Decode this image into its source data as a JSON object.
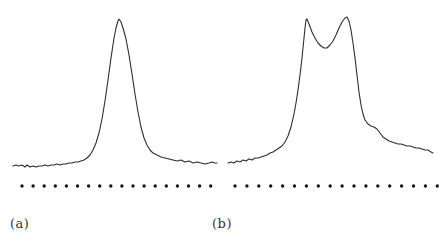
{
  "figure": {
    "background": "#ffffff",
    "line_color": "#2e2e2e",
    "dot_color": "#161616",
    "label_color": "#333333"
  },
  "chart_data": [
    {
      "type": "line",
      "label": "(a)",
      "title": "",
      "xlabel": "",
      "ylabel": "",
      "axes_visible": false,
      "grid": false,
      "legend": false,
      "description": "Single-peak intensity profile with noisy flat baseline; apex near x=119, baseline near y=165 (image pixels, y-down); row of evenly spaced sampling dots below the trace",
      "coordinate_system": "image-pixels-y-down",
      "points": [
        [
          13,
          166
        ],
        [
          16,
          165
        ],
        [
          19,
          166
        ],
        [
          22,
          165
        ],
        [
          25,
          167
        ],
        [
          27,
          165
        ],
        [
          30,
          167
        ],
        [
          33,
          166
        ],
        [
          36,
          167
        ],
        [
          39,
          166
        ],
        [
          42,
          166
        ],
        [
          45,
          165
        ],
        [
          48,
          166
        ],
        [
          51,
          165
        ],
        [
          54,
          165
        ],
        [
          57,
          164
        ],
        [
          60,
          165
        ],
        [
          63,
          164
        ],
        [
          66,
          164
        ],
        [
          69,
          163
        ],
        [
          72,
          163
        ],
        [
          75,
          162
        ],
        [
          78,
          162
        ],
        [
          81,
          161
        ],
        [
          84,
          160
        ],
        [
          87,
          158
        ],
        [
          90,
          155
        ],
        [
          93,
          150
        ],
        [
          96,
          143
        ],
        [
          99,
          133
        ],
        [
          102,
          119
        ],
        [
          105,
          101
        ],
        [
          108,
          80
        ],
        [
          111,
          58
        ],
        [
          114,
          38
        ],
        [
          116,
          28
        ],
        [
          118,
          21
        ],
        [
          119,
          19
        ],
        [
          121,
          22
        ],
        [
          123,
          28
        ],
        [
          126,
          39
        ],
        [
          129,
          55
        ],
        [
          132,
          74
        ],
        [
          135,
          94
        ],
        [
          138,
          112
        ],
        [
          141,
          127
        ],
        [
          144,
          138
        ],
        [
          147,
          145
        ],
        [
          150,
          150
        ],
        [
          153,
          153
        ],
        [
          157,
          155
        ],
        [
          161,
          157
        ],
        [
          165,
          158
        ],
        [
          169,
          159
        ],
        [
          173,
          160
        ],
        [
          177,
          161
        ],
        [
          181,
          160
        ],
        [
          185,
          162
        ],
        [
          189,
          161
        ],
        [
          193,
          163
        ],
        [
          197,
          162
        ],
        [
          201,
          163
        ],
        [
          205,
          164
        ],
        [
          209,
          163
        ],
        [
          212,
          162
        ],
        [
          215,
          163
        ],
        [
          217,
          163
        ]
      ],
      "dot_row": {
        "y": 186,
        "x_start": 22,
        "spacing": 11.1,
        "count": 18,
        "radius": 1.7
      }
    },
    {
      "type": "line",
      "label": "(b)",
      "title": "",
      "xlabel": "",
      "ylabel": "",
      "axes_visible": false,
      "grid": false,
      "legend": false,
      "description": "Double-peak intensity profile with noisy baseline; apexes near x=306 and x=347 with dip near x=327 (image pixels, y-down); row of evenly spaced sampling dots below the trace",
      "coordinate_system": "image-pixels-y-down",
      "points": [
        [
          228,
          163
        ],
        [
          231,
          162
        ],
        [
          234,
          163
        ],
        [
          237,
          161
        ],
        [
          240,
          162
        ],
        [
          243,
          160
        ],
        [
          246,
          161
        ],
        [
          249,
          159
        ],
        [
          252,
          160
        ],
        [
          255,
          158
        ],
        [
          258,
          158
        ],
        [
          261,
          157
        ],
        [
          264,
          156
        ],
        [
          267,
          155
        ],
        [
          270,
          153
        ],
        [
          273,
          152
        ],
        [
          276,
          150
        ],
        [
          279,
          148
        ],
        [
          282,
          146
        ],
        [
          285,
          142
        ],
        [
          288,
          136
        ],
        [
          291,
          127
        ],
        [
          294,
          114
        ],
        [
          296,
          103
        ],
        [
          298,
          90
        ],
        [
          300,
          75
        ],
        [
          302,
          58
        ],
        [
          304,
          38
        ],
        [
          305,
          28
        ],
        [
          306,
          20
        ],
        [
          307,
          19
        ],
        [
          309,
          24
        ],
        [
          312,
          32
        ],
        [
          315,
          38
        ],
        [
          318,
          43
        ],
        [
          321,
          46
        ],
        [
          324,
          48
        ],
        [
          327,
          48
        ],
        [
          330,
          45
        ],
        [
          333,
          41
        ],
        [
          336,
          35
        ],
        [
          339,
          28
        ],
        [
          342,
          22
        ],
        [
          345,
          18
        ],
        [
          347,
          17
        ],
        [
          349,
          21
        ],
        [
          351,
          30
        ],
        [
          353,
          43
        ],
        [
          355,
          58
        ],
        [
          357,
          75
        ],
        [
          359,
          92
        ],
        [
          361,
          105
        ],
        [
          363,
          114
        ],
        [
          365,
          120
        ],
        [
          368,
          124
        ],
        [
          371,
          126
        ],
        [
          374,
          127
        ],
        [
          377,
          129
        ],
        [
          380,
          133
        ],
        [
          383,
          137
        ],
        [
          386,
          139
        ],
        [
          389,
          141
        ],
        [
          392,
          142
        ],
        [
          395,
          143
        ],
        [
          398,
          144
        ],
        [
          401,
          144
        ],
        [
          404,
          145
        ],
        [
          407,
          146
        ],
        [
          410,
          146
        ],
        [
          413,
          147
        ],
        [
          416,
          148
        ],
        [
          419,
          148
        ],
        [
          422,
          149
        ],
        [
          425,
          150
        ],
        [
          428,
          150
        ],
        [
          431,
          152
        ],
        [
          433,
          153
        ]
      ],
      "dot_row": {
        "y": 186,
        "x_start": 235,
        "spacing": 11.9,
        "count": 18,
        "radius": 1.7
      }
    }
  ]
}
